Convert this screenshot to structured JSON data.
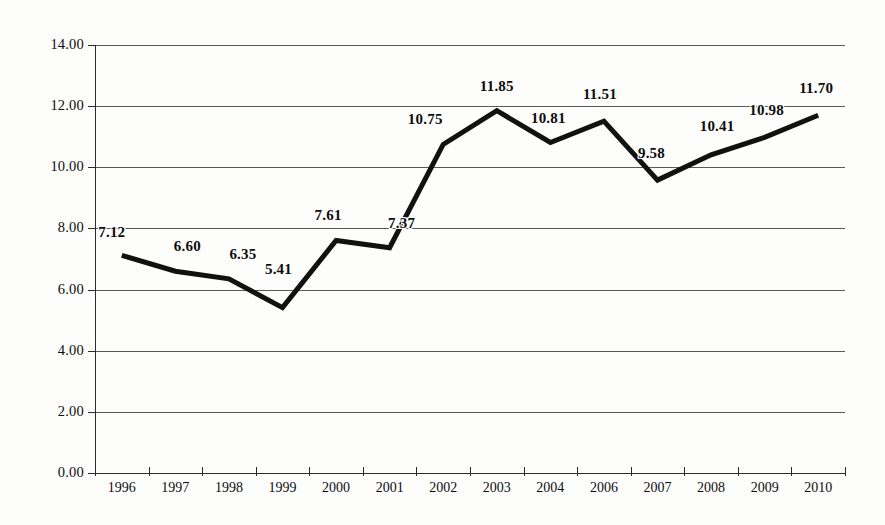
{
  "chart_data": {
    "type": "line",
    "title": "",
    "subtitle": "",
    "xlabel": "",
    "ylabel": "",
    "categories": [
      "1996",
      "1997",
      "1998",
      "1999",
      "2000",
      "2001",
      "2002",
      "2003",
      "2004",
      "2006",
      "2007",
      "2008",
      "2009",
      "2010"
    ],
    "values": [
      7.12,
      6.6,
      6.35,
      5.41,
      7.61,
      7.37,
      10.75,
      11.85,
      10.81,
      11.51,
      9.58,
      10.41,
      10.98,
      11.7
    ],
    "point_labels": [
      "7.12",
      "6.60",
      "6.35",
      "5.41",
      "7.61",
      "7.37",
      "10.75",
      "11.85",
      "10.81",
      "11.51",
      "9.58",
      "10.41",
      "10.98",
      "11.70"
    ],
    "ylim": [
      0,
      14
    ],
    "ytick_step": 2,
    "ytick_labels": [
      "0.00",
      "2.00",
      "4.00",
      "6.00",
      "8.00",
      "10.00",
      "12.00",
      "14.00"
    ],
    "ytick_values": [
      0,
      2,
      4,
      6,
      8,
      10,
      12,
      14
    ],
    "grid": "horizontal",
    "legend": "none",
    "series_color": "#111111",
    "grid_color": "#595959",
    "axis_color": "#2b2b2b",
    "label_color": "#0d0d0d",
    "background_color": "#fdfdfc",
    "data_labels_shown": true,
    "markers": "none",
    "note": "2005 is absent from the category axis"
  }
}
